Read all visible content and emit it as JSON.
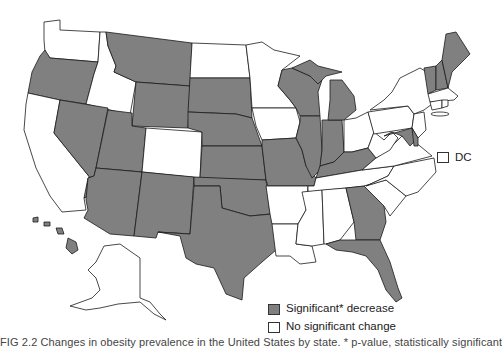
{
  "map": {
    "title": "",
    "region": "United States",
    "colors": {
      "significant_decrease": "#808080",
      "no_significant_change": "#ffffff",
      "border": "#1a1a1a"
    },
    "states": {
      "significant_decrease": [
        "OR",
        "MT",
        "WY",
        "SD",
        "NE",
        "KS",
        "OK",
        "TX",
        "NV",
        "UT",
        "AZ",
        "NM",
        "MO",
        "IL",
        "IN",
        "WI",
        "MI",
        "KY",
        "GA",
        "FL",
        "HI",
        "ME",
        "NH",
        "VT",
        "MD",
        "DE"
      ],
      "no_significant_change": [
        "WA",
        "ID",
        "CA",
        "CO",
        "ND",
        "MN",
        "IA",
        "AR",
        "LA",
        "MS",
        "AL",
        "TN",
        "SC",
        "NC",
        "VA",
        "WV",
        "OH",
        "PA",
        "NY",
        "NJ",
        "CT",
        "RI",
        "MA",
        "AK",
        "DC"
      ]
    }
  },
  "legend": {
    "items": [
      {
        "label": "Significant* decrease",
        "color": "#808080"
      },
      {
        "label": "No significant change",
        "color": "#ffffff"
      }
    ],
    "dc_label": "DC"
  },
  "caption": "FIG 2.2  Changes in obesity prevalence in the United States by state. * p-value, statistically significant"
}
